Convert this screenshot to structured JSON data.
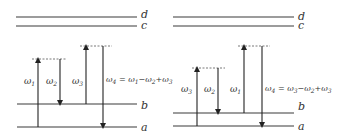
{
  "levels": {
    "a": "a",
    "b": "b",
    "c": "c",
    "d": "d"
  },
  "left_panel": {
    "labels": {
      "w1": "ω",
      "w1_sub": "1",
      "w2": "ω",
      "w2_sub": "2",
      "w3": "ω",
      "w3_sub": "3",
      "w4": "ω",
      "w4_sub": "4",
      "eq": " = ω",
      "eq_s1": "1",
      "eq_m": "−ω",
      "eq_s2": "2",
      "eq_p": "+ω",
      "eq_s3": "3"
    }
  },
  "right_panel": {
    "labels": {
      "w3": "ω",
      "w3_sub": "3",
      "w2": "ω",
      "w2_sub": "2",
      "w1": "ω",
      "w1_sub": "1",
      "w4": "ω",
      "w4_sub": "4",
      "eq": " = ω",
      "eq_s1": "3",
      "eq_m": "−ω",
      "eq_s2": "2",
      "eq_p": "+ω",
      "eq_s3": "3"
    }
  },
  "colors": {
    "line": "#3a3a3a",
    "background": "#ffffff"
  }
}
